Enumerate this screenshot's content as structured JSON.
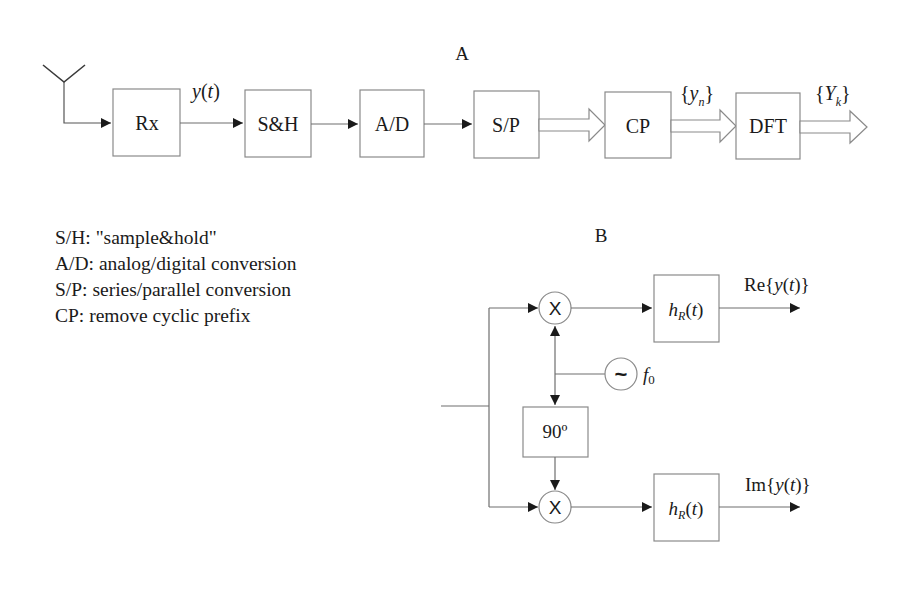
{
  "diagram_a": {
    "title": "A",
    "blocks": [
      {
        "id": "rx",
        "label": "Rx"
      },
      {
        "id": "sh",
        "label": "S&H"
      },
      {
        "id": "ad",
        "label": "A/D"
      },
      {
        "id": "sp",
        "label": "S/P"
      },
      {
        "id": "cp",
        "label": "CP"
      },
      {
        "id": "dft",
        "label": "DFT"
      }
    ],
    "signals": {
      "rx_out": "y(t)",
      "cp_out": "{yn}",
      "dft_out": "{Yk}"
    }
  },
  "legend": [
    "S/H: \"sample&hold\"",
    "A/D: analog/digital conversion",
    "S/P: series/parallel conversion",
    "CP: remove cyclic prefix"
  ],
  "diagram_b": {
    "title": "B",
    "mixer_symbol": "X",
    "oscillator_symbol": "~",
    "oscillator_freq": "f0",
    "phase_shift": "90º",
    "filter_label": "hR(t)",
    "output_re": "Re{y(t)}",
    "output_im": "Im{y(t)}"
  }
}
